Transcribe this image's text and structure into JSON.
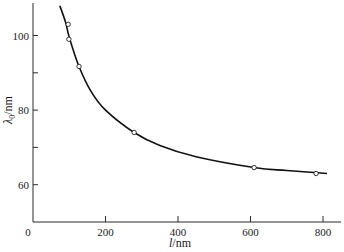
{
  "chart_data": {
    "type": "line",
    "title": "",
    "xlabel": "l/nm",
    "ylabel": "λ0/nm",
    "xlim": [
      0,
      850
    ],
    "ylim": [
      50,
      109
    ],
    "x_ticks": [
      0,
      200,
      400,
      600,
      800
    ],
    "x_tick_labels": [
      "0",
      "200",
      "400",
      "600",
      "800"
    ],
    "y_ticks": [
      60,
      70,
      80,
      90,
      100
    ],
    "y_tick_labels": [
      "60",
      "",
      "80",
      "",
      "100"
    ],
    "grid": false,
    "legend": null,
    "series": [
      {
        "name": "measured",
        "style": "open-circle markers",
        "x": [
          97,
          99,
          127,
          279,
          610,
          781
        ],
        "y": [
          103,
          99,
          91.7,
          74,
          64.6,
          63
        ]
      },
      {
        "name": "fit",
        "style": "solid curve",
        "x": [
          74,
          90,
          100,
          127,
          160,
          200,
          279,
          350,
          450,
          610,
          700,
          811
        ],
        "y": [
          108,
          103.5,
          99.5,
          91.7,
          85,
          80,
          74,
          70.5,
          67.5,
          64.6,
          63.8,
          63
        ]
      }
    ]
  }
}
